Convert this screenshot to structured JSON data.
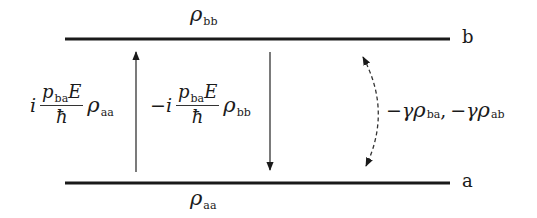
{
  "diagram": {
    "type": "two-level density matrix transition diagram",
    "levels": {
      "upper": {
        "label": "b",
        "population_label": {
          "symbol": "ρ",
          "subscript": "bb"
        }
      },
      "lower": {
        "label": "a",
        "population_label": {
          "symbol": "ρ",
          "subscript": "aa"
        }
      }
    },
    "transitions": [
      {
        "direction": "up",
        "prefix": "i",
        "numerator": {
          "symbol": "p",
          "subscript": "ba",
          "tail": "E"
        },
        "denominator": "ħ",
        "factor": {
          "symbol": "ρ",
          "subscript": "aa"
        }
      },
      {
        "direction": "down",
        "prefix": "−i",
        "numerator": {
          "symbol": "p",
          "subscript": "ba",
          "tail": "E"
        },
        "denominator": "ħ",
        "factor": {
          "symbol": "ρ",
          "subscript": "bb"
        }
      }
    ],
    "decay": {
      "style": "dashed double-headed arc",
      "terms": [
        {
          "prefix": "−γ",
          "symbol": "ρ",
          "subscript": "ba",
          "separator": ","
        },
        {
          "prefix": "−γ",
          "symbol": "ρ",
          "subscript": "ab",
          "separator": ""
        }
      ]
    },
    "colors": {
      "line": "#1a1a1a",
      "background": "#ffffff"
    }
  }
}
